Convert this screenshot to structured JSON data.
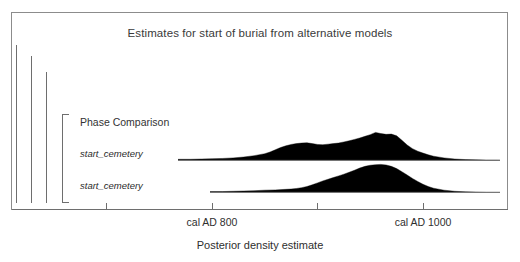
{
  "chart_data": {
    "type": "area",
    "title": "Estimates for start of burial from alternative models",
    "xlabel": "Posterior density estimate",
    "ylabel": "",
    "grid": false,
    "legend_position": "none",
    "xlim": [
      600,
      1100
    ],
    "axis_ticks": [
      {
        "label": "",
        "value": 700,
        "x_px": 106
      },
      {
        "label": "cal AD 800",
        "value": 800,
        "x_px": 212
      },
      {
        "label": "",
        "value": 900,
        "x_px": 317
      },
      {
        "label": "cal AD 1000",
        "value": 1000,
        "x_px": 423
      }
    ],
    "group_label": "Phase Comparison",
    "series": [
      {
        "name": "start_cemetery",
        "label": "start_cemetery",
        "baseline_x_start": 178,
        "baseline_x_end": 498,
        "baseline_y_px": 160,
        "peak_x_value": 955,
        "shape": "rough-bimodal",
        "points": [
          [
            600,
            0.0
          ],
          [
            610,
            0.0
          ],
          [
            620,
            0.0
          ],
          [
            630,
            0.0
          ],
          [
            640,
            0.0
          ],
          [
            650,
            0.01
          ],
          [
            660,
            0.01
          ],
          [
            670,
            0.01
          ],
          [
            680,
            0.01
          ],
          [
            690,
            0.01
          ],
          [
            700,
            0.02
          ],
          [
            710,
            0.02
          ],
          [
            720,
            0.02
          ],
          [
            730,
            0.02
          ],
          [
            740,
            0.03
          ],
          [
            750,
            0.03
          ],
          [
            760,
            0.03
          ],
          [
            770,
            0.04
          ],
          [
            780,
            0.04
          ],
          [
            790,
            0.05
          ],
          [
            800,
            0.06
          ],
          [
            810,
            0.07
          ],
          [
            820,
            0.09
          ],
          [
            830,
            0.12
          ],
          [
            840,
            0.17
          ],
          [
            850,
            0.24
          ],
          [
            855,
            0.3
          ],
          [
            860,
            0.38
          ],
          [
            865,
            0.46
          ],
          [
            870,
            0.52
          ],
          [
            875,
            0.57
          ],
          [
            880,
            0.6
          ],
          [
            885,
            0.62
          ],
          [
            890,
            0.63
          ],
          [
            895,
            0.6
          ],
          [
            900,
            0.57
          ],
          [
            905,
            0.56
          ],
          [
            910,
            0.58
          ],
          [
            915,
            0.6
          ],
          [
            920,
            0.62
          ],
          [
            925,
            0.66
          ],
          [
            930,
            0.7
          ],
          [
            935,
            0.75
          ],
          [
            940,
            0.8
          ],
          [
            945,
            0.86
          ],
          [
            950,
            0.92
          ],
          [
            955,
            1.0
          ],
          [
            960,
            0.96
          ],
          [
            965,
            0.93
          ],
          [
            970,
            0.94
          ],
          [
            975,
            0.88
          ],
          [
            980,
            0.72
          ],
          [
            985,
            0.55
          ],
          [
            990,
            0.42
          ],
          [
            995,
            0.33
          ],
          [
            1000,
            0.26
          ],
          [
            1005,
            0.2
          ],
          [
            1010,
            0.15
          ],
          [
            1020,
            0.09
          ],
          [
            1030,
            0.05
          ],
          [
            1040,
            0.03
          ],
          [
            1050,
            0.02
          ],
          [
            1060,
            0.01
          ],
          [
            1070,
            0.01
          ],
          [
            1080,
            0.0
          ],
          [
            1090,
            0.0
          ],
          [
            1100,
            0.0
          ]
        ]
      },
      {
        "name": "start_cemetery",
        "label": "start_cemetery",
        "baseline_x_start": 210,
        "baseline_x_end": 498,
        "baseline_y_px": 192,
        "peak_x_value": 960,
        "shape": "smooth-unimodal",
        "points": [
          [
            600,
            0.0
          ],
          [
            620,
            0.0
          ],
          [
            640,
            0.0
          ],
          [
            660,
            0.0
          ],
          [
            680,
            0.0
          ],
          [
            700,
            0.0
          ],
          [
            720,
            0.01
          ],
          [
            740,
            0.01
          ],
          [
            760,
            0.01
          ],
          [
            780,
            0.02
          ],
          [
            800,
            0.03
          ],
          [
            810,
            0.03
          ],
          [
            820,
            0.04
          ],
          [
            830,
            0.05
          ],
          [
            840,
            0.06
          ],
          [
            850,
            0.08
          ],
          [
            860,
            0.09
          ],
          [
            870,
            0.11
          ],
          [
            875,
            0.12
          ],
          [
            880,
            0.14
          ],
          [
            885,
            0.17
          ],
          [
            890,
            0.21
          ],
          [
            895,
            0.27
          ],
          [
            900,
            0.34
          ],
          [
            905,
            0.41
          ],
          [
            910,
            0.47
          ],
          [
            915,
            0.53
          ],
          [
            920,
            0.59
          ],
          [
            925,
            0.65
          ],
          [
            930,
            0.72
          ],
          [
            935,
            0.79
          ],
          [
            940,
            0.87
          ],
          [
            945,
            0.93
          ],
          [
            950,
            0.97
          ],
          [
            955,
            0.99
          ],
          [
            960,
            1.0
          ],
          [
            965,
            0.98
          ],
          [
            970,
            0.93
          ],
          [
            975,
            0.85
          ],
          [
            980,
            0.74
          ],
          [
            985,
            0.62
          ],
          [
            990,
            0.5
          ],
          [
            995,
            0.39
          ],
          [
            1000,
            0.29
          ],
          [
            1005,
            0.21
          ],
          [
            1010,
            0.15
          ],
          [
            1020,
            0.08
          ],
          [
            1030,
            0.04
          ],
          [
            1040,
            0.02
          ],
          [
            1050,
            0.01
          ],
          [
            1060,
            0.0
          ],
          [
            1080,
            0.0
          ],
          [
            1100,
            0.0
          ]
        ]
      }
    ],
    "model_brackets": [
      {
        "x_px": 16,
        "top_px": 45,
        "bottom_px": 203
      },
      {
        "x_px": 31,
        "top_px": 56,
        "bottom_px": 203
      },
      {
        "x_px": 46,
        "top_px": 72,
        "bottom_px": 203
      }
    ]
  },
  "colors": {
    "fill": "#000000",
    "axis": "#6e6e6e",
    "frame": "#8c8c8c",
    "text": "#2e2e2e",
    "background": "#ffffff"
  }
}
